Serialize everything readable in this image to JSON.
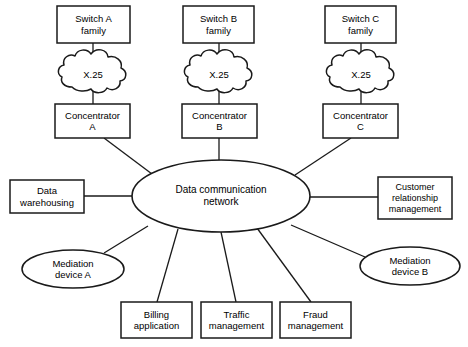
{
  "diagram": {
    "background_color": "#ffffff",
    "stroke_color": "#1a1a1a",
    "center": {
      "label": "Data communication\nnetwork",
      "shape": "ellipse",
      "cx": 221,
      "cy": 196,
      "rx": 89,
      "ry": 36
    },
    "columns": [
      {
        "id": "a",
        "switch": {
          "label": "Switch A\nfamily",
          "shape": "rect",
          "x": 57,
          "y": 6,
          "w": 73,
          "h": 37
        },
        "cloud": {
          "label": "X.25",
          "shape": "cloud",
          "cx": 93,
          "cy": 75,
          "rx": 32,
          "ry": 18
        },
        "concentrator": {
          "label": "Concentrator\nA",
          "shape": "rect",
          "x": 55,
          "y": 104,
          "w": 75,
          "h": 34
        }
      },
      {
        "id": "b",
        "switch": {
          "label": "Switch B\nfamily",
          "shape": "rect",
          "x": 183,
          "y": 6,
          "w": 71,
          "h": 37
        },
        "cloud": {
          "label": "X.25",
          "shape": "cloud",
          "cx": 219,
          "cy": 75,
          "rx": 32,
          "ry": 18
        },
        "concentrator": {
          "label": "Concentrator\nB",
          "shape": "rect",
          "x": 182,
          "y": 104,
          "w": 75,
          "h": 34
        }
      },
      {
        "id": "c",
        "switch": {
          "label": "Switch C\nfamily",
          "shape": "rect",
          "x": 325,
          "y": 6,
          "w": 71,
          "h": 37
        },
        "cloud": {
          "label": "X.25",
          "shape": "cloud",
          "cx": 361,
          "cy": 75,
          "rx": 32,
          "ry": 18
        },
        "concentrator": {
          "label": "Concentrator\nC",
          "shape": "rect",
          "x": 323,
          "y": 104,
          "w": 75,
          "h": 34
        }
      }
    ],
    "peripherals": [
      {
        "id": "data-warehousing",
        "label": "Data\nwarehousing",
        "shape": "rect",
        "x": 10,
        "y": 180,
        "w": 74,
        "h": 33
      },
      {
        "id": "mediation-device-a",
        "label": "Mediation\ndevice A",
        "shape": "ellipse",
        "cx": 73,
        "cy": 269,
        "rx": 51,
        "ry": 19
      },
      {
        "id": "billing-application",
        "label": "Billing\napplication",
        "shape": "rect",
        "x": 121,
        "y": 302,
        "w": 71,
        "h": 36
      },
      {
        "id": "traffic-management",
        "label": "Traffic\nmanagement",
        "shape": "rect",
        "x": 201,
        "y": 302,
        "w": 71,
        "h": 36
      },
      {
        "id": "fraud-management",
        "label": "Fraud\nmanagement",
        "shape": "rect",
        "x": 280,
        "y": 302,
        "w": 71,
        "h": 36
      },
      {
        "id": "mediation-device-b",
        "label": "Mediation\ndevice B",
        "shape": "ellipse",
        "cx": 410,
        "cy": 266,
        "rx": 50,
        "ry": 19
      },
      {
        "id": "customer-relationship-management",
        "label": "Customer\nrelationship\nmanagement",
        "shape": "rect",
        "x": 378,
        "y": 177,
        "w": 74,
        "h": 42
      }
    ],
    "connections": [
      {
        "from": "switch-a",
        "to": "cloud-a"
      },
      {
        "from": "cloud-a",
        "to": "concentrator-a"
      },
      {
        "from": "concentrator-a",
        "to": "network"
      },
      {
        "from": "switch-b",
        "to": "cloud-b"
      },
      {
        "from": "cloud-b",
        "to": "concentrator-b"
      },
      {
        "from": "concentrator-b",
        "to": "network"
      },
      {
        "from": "switch-c",
        "to": "cloud-c"
      },
      {
        "from": "cloud-c",
        "to": "concentrator-c"
      },
      {
        "from": "concentrator-c",
        "to": "network"
      },
      {
        "from": "network",
        "to": "data-warehousing"
      },
      {
        "from": "network",
        "to": "mediation-device-a"
      },
      {
        "from": "network",
        "to": "billing-application"
      },
      {
        "from": "network",
        "to": "traffic-management"
      },
      {
        "from": "network",
        "to": "fraud-management"
      },
      {
        "from": "network",
        "to": "mediation-device-b"
      },
      {
        "from": "network",
        "to": "customer-relationship-management"
      }
    ]
  }
}
